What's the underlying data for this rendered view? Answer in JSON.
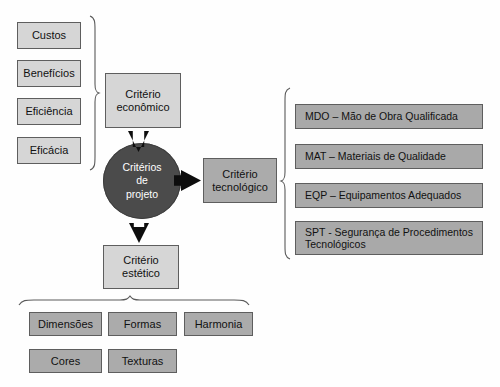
{
  "diagram": {
    "center_node": {
      "label_line1": "Critérios",
      "label_line2": "de",
      "label_line3": "projeto",
      "color": "#4b4b4b",
      "text_color": "#ffffff"
    },
    "criteria": [
      {
        "name": "criterio-economico",
        "line1": "Critério",
        "line2": "econômico",
        "color": "#d6d6d6"
      },
      {
        "name": "criterio-tecnologico",
        "line1": "Critério",
        "line2": "tecnológico",
        "color": "#ababab"
      },
      {
        "name": "criterio-estetico",
        "line1": "Critério",
        "line2": "estético",
        "color": "#d6d6d6"
      }
    ],
    "economic_items": [
      {
        "label": "Custos"
      },
      {
        "label": "Benefícios"
      },
      {
        "label": "Eficiência"
      },
      {
        "label": "Eficácia"
      }
    ],
    "technological_items": [
      {
        "label": "MDO – Mão de Obra Qualificada"
      },
      {
        "label": "MAT – Materiais de Qualidade"
      },
      {
        "label": "EQP – Equipamentos Adequados"
      },
      {
        "label": "SPT - Segurança de Procedimentos Tecnológicos"
      }
    ],
    "aesthetic_items": [
      {
        "label": "Dimensões"
      },
      {
        "label": "Formas"
      },
      {
        "label": "Harmonia"
      },
      {
        "label": "Cores"
      },
      {
        "label": "Texturas"
      }
    ],
    "colors": {
      "box_light": "#d6d6d6",
      "box_mid": "#ababab",
      "border": "#5e5e5e",
      "arrow": "#0d0d0d",
      "brace": "#5a5a5a",
      "background": "#fefefe"
    }
  }
}
